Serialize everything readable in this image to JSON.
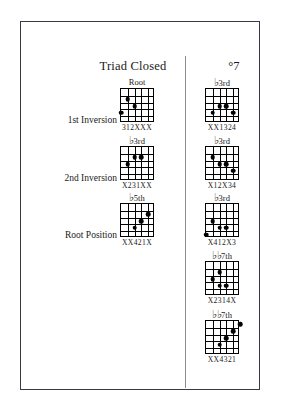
{
  "page": {
    "columns": [
      {
        "id": "triad-closed",
        "header": "Triad Closed"
      },
      {
        "id": "dim7",
        "header": "°7"
      }
    ],
    "row_labels": [
      {
        "id": "first-inversion",
        "label": "1st Inversion"
      },
      {
        "id": "second-inversion",
        "label": "2nd Inversion"
      },
      {
        "id": "root-position",
        "label": "Root Position"
      }
    ]
  },
  "diagrams": {
    "left": [
      {
        "id": "triad-1st-inversion",
        "interval": "Root",
        "accidental": "",
        "fingering": "312XXX",
        "strings": 6,
        "frets": 5,
        "dots": [
          {
            "string": 2,
            "fret": 2
          },
          {
            "string": 3,
            "fret": 3
          },
          {
            "string": 1,
            "fret": 4
          }
        ]
      },
      {
        "id": "triad-2nd-inversion",
        "interval": "3rd",
        "accidental": "♭",
        "fingering": "X231XX",
        "strings": 6,
        "frets": 5,
        "dots": [
          {
            "string": 3,
            "fret": 2
          },
          {
            "string": 2,
            "fret": 3
          },
          {
            "string": 4,
            "fret": 2
          }
        ]
      },
      {
        "id": "triad-root-position",
        "interval": "5th",
        "accidental": "♭",
        "fingering": "XX421X",
        "strings": 6,
        "frets": 5,
        "dots": [
          {
            "string": 5,
            "fret": 2
          },
          {
            "string": 4,
            "fret": 3
          },
          {
            "string": 3,
            "fret": 4
          }
        ]
      }
    ],
    "right": [
      {
        "id": "dim7-1st-inversion",
        "interval": "3rd",
        "accidental": "♭",
        "fingering": "XX1324",
        "strings": 6,
        "frets": 5,
        "dots": [
          {
            "string": 3,
            "fret": 3
          },
          {
            "string": 4,
            "fret": 3
          },
          {
            "string": 2,
            "fret": 4
          },
          {
            "string": 5,
            "fret": 4
          }
        ]
      },
      {
        "id": "dim7-2nd-inversion",
        "interval": "3rd",
        "accidental": "♭",
        "fingering": "X12X34",
        "strings": 6,
        "frets": 5,
        "dots": [
          {
            "string": 2,
            "fret": 2
          },
          {
            "string": 3,
            "fret": 3
          },
          {
            "string": 4,
            "fret": 3
          },
          {
            "string": 5,
            "fret": 4
          }
        ]
      },
      {
        "id": "dim7-root-position",
        "interval": "3rd",
        "accidental": "♭",
        "fingering": "X412X3",
        "strings": 6,
        "frets": 5,
        "dots": [
          {
            "string": 2,
            "fret": 3
          },
          {
            "string": 3,
            "fret": 4
          },
          {
            "string": 4,
            "fret": 4
          },
          {
            "string": 1,
            "fret": 5
          }
        ]
      },
      {
        "id": "dim7-fourth",
        "interval": "7th",
        "accidental": "♭♭",
        "fingering": "X2314X",
        "strings": 6,
        "frets": 5,
        "dots": [
          {
            "string": 3,
            "fret": 2
          },
          {
            "string": 2,
            "fret": 3
          },
          {
            "string": 3,
            "fret": 4
          },
          {
            "string": 4,
            "fret": 4
          }
        ]
      },
      {
        "id": "dim7-fifth",
        "interval": "7th",
        "accidental": "♭♭",
        "fingering": "XX4321",
        "strings": 6,
        "frets": 5,
        "dots": [
          {
            "string": 6,
            "fret": 1
          },
          {
            "string": 5,
            "fret": 2
          },
          {
            "string": 4,
            "fret": 3
          },
          {
            "string": 3,
            "fret": 4
          }
        ]
      }
    ]
  }
}
